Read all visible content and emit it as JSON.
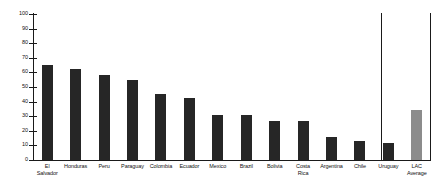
{
  "chart_data": {
    "type": "bar",
    "title": "",
    "subtitle": "",
    "xlabel": "",
    "ylabel": "",
    "ylim": [
      0,
      100
    ],
    "ytick_step": 10,
    "grid": false,
    "legend": null,
    "categories": [
      "El\nSalvador",
      "Honduras",
      "Peru",
      "Paraguay",
      "Colombia",
      "Ecuador",
      "Mexico",
      "Brazil",
      "Bolivia",
      "Costa\nRica",
      "Argentina",
      "Chile",
      "Uruguay",
      "LAC\nAverage"
    ],
    "values": [
      65,
      62,
      58.5,
      55,
      45,
      42.5,
      30.5,
      30.5,
      27,
      27,
      16,
      13,
      11.5,
      34
    ],
    "ytick_labels": [
      "0",
      "10",
      "20",
      "30",
      "40",
      "50",
      "60",
      "70",
      "80",
      "90",
      "100"
    ],
    "ytick_values": [
      0,
      10,
      20,
      30,
      40,
      50,
      60,
      70,
      80,
      90,
      100
    ],
    "series_colors": {
      "country_bar": "#262626",
      "average_bar": "#8c8c8c",
      "axis": "#1a1a1a"
    },
    "highlight_index": 13,
    "annotations": []
  }
}
